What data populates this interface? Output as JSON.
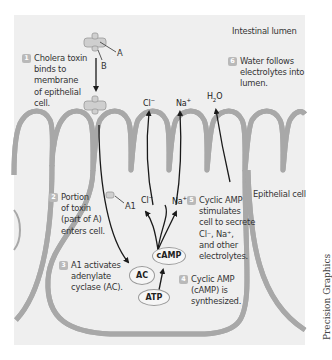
{
  "labels": {
    "lumen": "Intestinal lumen",
    "epithelial_cell": "Epithelial cell",
    "subunit_a": "A",
    "subunit_b": "B",
    "a1": "A1",
    "credit": "Precision Graphics"
  },
  "ions": {
    "cl_top": "Cl",
    "cl_top_sup": "−",
    "na_top": "Na",
    "na_top_sup": "+",
    "h2o_h": "H",
    "h2o_sub": "2",
    "h2o_o": "O",
    "cl_mid": "Cl",
    "cl_mid_sup": "−",
    "na_mid": "Na",
    "na_mid_sup": "+"
  },
  "molecules": {
    "ac": "AC",
    "camp": "cAMP",
    "atp": "ATP"
  },
  "steps": [
    {
      "num": "1",
      "text": "Cholera toxin\nbinds to\nmembrane\nof epithelial\ncell."
    },
    {
      "num": "2",
      "text": "Portion\nof toxin\n(part of A)\nenters cell."
    },
    {
      "num": "3",
      "text": "A1 activates\nadenylate\ncyclase (AC)."
    },
    {
      "num": "4",
      "text": "Cyclic AMP\n(cAMP) is\nsynthesized."
    },
    {
      "num": "5",
      "text": "Cyclic AMP\nstimulates\ncell to secrete\nCl⁻, Na⁺,\nand other\nelectrolytes."
    },
    {
      "num": "6",
      "text": "Water follows\nelectrolytes into\nlumen."
    }
  ],
  "colors": {
    "panel_bg": "#efefef",
    "membrane": "#a8a8a8",
    "arrow": "#1a1a1a",
    "badge": "#b9b9b9"
  }
}
